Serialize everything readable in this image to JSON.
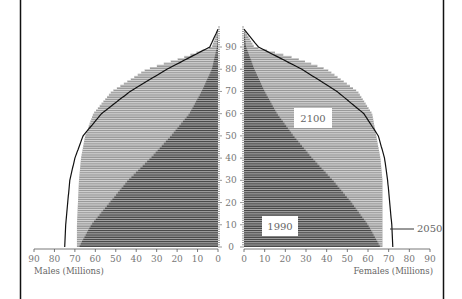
{
  "chart_data": {
    "type": "bar",
    "subtype": "population-pyramid",
    "title": "",
    "left_axis_label": "Males (Millions)",
    "right_axis_label": "Females (Millions)",
    "x_ticks": [
      0,
      10,
      20,
      30,
      40,
      50,
      60,
      70,
      80,
      90
    ],
    "age_ticks": [
      0,
      10,
      20,
      30,
      40,
      50,
      60,
      70,
      80,
      90
    ],
    "xlim": [
      0,
      90
    ],
    "age_range": [
      0,
      99
    ],
    "series": [
      {
        "name": "1990",
        "style": "dark horizontal bars",
        "color": "#4a4a4a",
        "age": [
          0,
          10,
          20,
          30,
          40,
          50,
          60,
          70,
          80,
          90,
          98
        ],
        "males": [
          68,
          62,
          53,
          44,
          33,
          23,
          14,
          8,
          3,
          0.5,
          0
        ],
        "females": [
          66,
          60,
          52,
          43,
          33,
          24,
          16,
          10,
          5,
          1,
          0
        ]
      },
      {
        "name": "2100",
        "style": "light horizontal bars",
        "color": "#9a9a9a",
        "age": [
          0,
          10,
          20,
          30,
          40,
          50,
          60,
          70,
          80,
          85,
          90,
          98
        ],
        "males": [
          69,
          69,
          68.5,
          68,
          67,
          65,
          61,
          52,
          35,
          18,
          3,
          0
        ],
        "females": [
          67,
          67,
          67,
          67,
          66,
          64,
          62,
          55,
          40,
          25,
          5,
          0
        ]
      },
      {
        "name": "2050",
        "style": "black line",
        "color": "#111111",
        "age": [
          0,
          10,
          20,
          30,
          40,
          50,
          60,
          70,
          80,
          90,
          98
        ],
        "males": [
          75,
          74.5,
          73.5,
          72.5,
          70,
          66,
          57,
          43,
          25,
          4,
          0
        ],
        "females": [
          72,
          71.5,
          70.5,
          69.5,
          68,
          65,
          58,
          45,
          28,
          7,
          0
        ]
      }
    ],
    "annotations": [
      "1990",
      "2100",
      "2050"
    ],
    "grid": false,
    "legend": "inline labels"
  }
}
